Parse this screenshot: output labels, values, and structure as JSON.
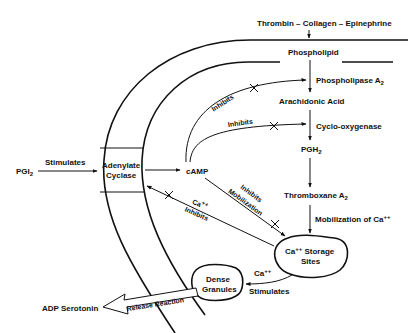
{
  "diagram": {
    "type": "platelet-biochemical-pathway",
    "nodes": {
      "agonists": "Thrombin – Collagen – Epinephrine",
      "phospholipid": "Phospholipid",
      "phospholipase_a2": "Phospholipase A",
      "phospholipase_a2_sub": "2",
      "arachidonic_acid": "Arachidonic Acid",
      "cyclo_oxygenase": "Cyclo-oxygenase",
      "pgh2": "PGH",
      "pgh2_sub": "2",
      "thromboxane_a2": "Thromboxane A",
      "thromboxane_a2_sub": "2",
      "mobilization_ca": "Mobilization of Ca",
      "mobilization_ca_sup": "++",
      "storage_sites_1": "Ca",
      "storage_sites_sup": "++",
      "storage_sites_2": " Storage",
      "storage_sites_3": "Sites",
      "dense_granules_1": "Dense",
      "dense_granules_2": "Granules",
      "adp_serotonin": "ADP Serotonin",
      "release_reaction": "Release Reaction",
      "pgi2": "PGI",
      "pgi2_sub": "2",
      "adenylate_cyclase_1": "Adenylate",
      "adenylate_cyclase_2": "Cyclase",
      "camp": "cAMP"
    },
    "edge_labels": {
      "stimulates_pgi2": "Stimulates",
      "inhibits_phospholipase": "Inhibits",
      "inhibits_cyclo": "Inhibits",
      "inhibits_mobilization_1": "Inhibits",
      "inhibits_mobilization_2": "Mobilization",
      "ca_inhibits_1": "Ca",
      "ca_inhibits_sup": "++",
      "ca_inhibits_2": "Inhibits",
      "ca_stimulates_1": "Ca",
      "ca_stimulates_sup": "++",
      "ca_stimulates_2": "Stimulates"
    },
    "edges": [
      {
        "from": "agonists",
        "to": "phospholipid",
        "type": "arrow"
      },
      {
        "from": "phospholipid",
        "to": "arachidonic_acid",
        "via": "phospholipase_a2",
        "type": "arrow"
      },
      {
        "from": "arachidonic_acid",
        "to": "pgh2",
        "via": "cyclo_oxygenase",
        "type": "arrow"
      },
      {
        "from": "pgh2",
        "to": "thromboxane_a2",
        "type": "arrow"
      },
      {
        "from": "thromboxane_a2",
        "to": "storage_sites",
        "label": "Mobilization of Ca++",
        "type": "arrow"
      },
      {
        "from": "pgi2",
        "to": "adenylate_cyclase",
        "label": "Stimulates",
        "type": "arrow"
      },
      {
        "from": "adenylate_cyclase",
        "to": "camp",
        "type": "arrow"
      },
      {
        "from": "camp",
        "to": "phospholipase_a2",
        "label": "Inhibits",
        "type": "inhibit"
      },
      {
        "from": "camp",
        "to": "cyclo_oxygenase",
        "label": "Inhibits",
        "type": "inhibit"
      },
      {
        "from": "camp",
        "to": "storage_sites",
        "label": "Inhibits Mobilization",
        "type": "inhibit"
      },
      {
        "from": "storage_sites",
        "to": "adenylate_cyclase",
        "label": "Ca++ Inhibits",
        "type": "inhibit"
      },
      {
        "from": "storage_sites",
        "to": "dense_granules",
        "label": "Ca++ Stimulates",
        "type": "arrow"
      },
      {
        "from": "dense_granules",
        "to": "adp_serotonin",
        "label": "Release Reaction",
        "type": "block-arrow"
      }
    ]
  }
}
